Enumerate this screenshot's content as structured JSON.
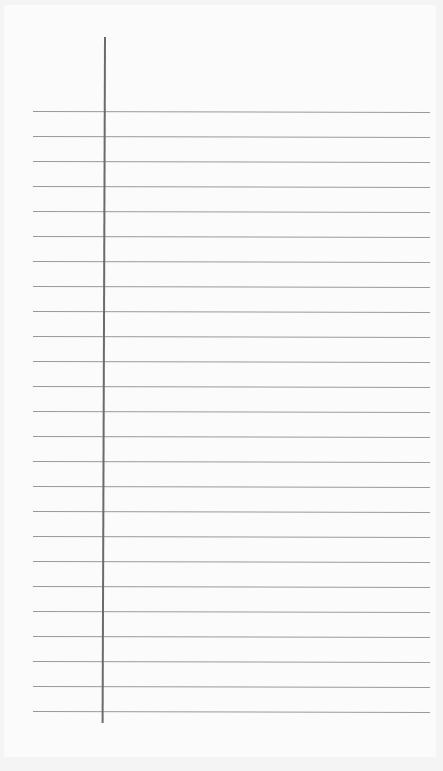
{
  "paper": {
    "type": "lined-notepaper",
    "rule_count": 25,
    "rule_start_y": 111,
    "rule_spacing": 25,
    "rule_color": "#9a9a9a",
    "margin_line_color": "#6b6b6b",
    "background_color": "#fbfbfb"
  }
}
